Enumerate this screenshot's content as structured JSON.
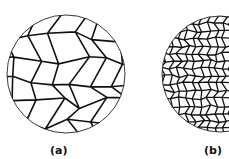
{
  "figure": {
    "type": "grain-structure-comparison",
    "panels": [
      {
        "id": "a",
        "label": "(a)",
        "description": "coarse grain structure"
      },
      {
        "id": "b",
        "label": "(b)",
        "description": "fine grain structure"
      }
    ],
    "colors": {
      "line": "#111111",
      "background": "#ffffff"
    }
  }
}
